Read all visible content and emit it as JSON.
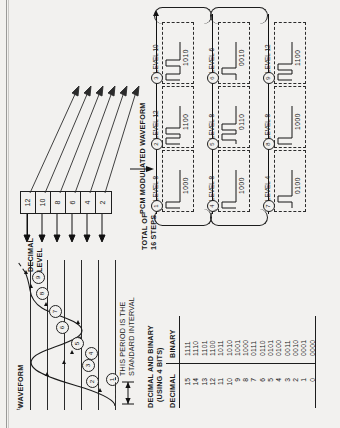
{
  "figure": {
    "waveform_panel": {
      "title": "WAVEFORM",
      "interval_note_line1": "THIS PERIOD IS THE",
      "interval_note_line2": "STANDARD INTERVAL",
      "interval_symbol": "t",
      "interval_symbol_sub": "s",
      "sample_points": [
        "1",
        "2",
        "3",
        "4",
        "5",
        "6",
        "7",
        "8",
        "9"
      ]
    },
    "decimal_level_scale": {
      "label_line1": "DECIMAL",
      "label_line2": "LEVEL",
      "values": [
        "12",
        "10",
        "8",
        "6",
        "4",
        "2"
      ]
    },
    "steps_note": {
      "line1": "TOTAL OF",
      "line2": "16 STEPS"
    },
    "table": {
      "title_line1": "DECIMAL AND BINARY",
      "title_line2": "(USING 4 BITS)",
      "columns": [
        "DECIMAL",
        "BINARY"
      ],
      "rows": [
        {
          "decimal": "15",
          "binary": "1111"
        },
        {
          "decimal": "14",
          "binary": "1110"
        },
        {
          "decimal": "13",
          "binary": "1101"
        },
        {
          "decimal": "12",
          "binary": "1100"
        },
        {
          "decimal": "11",
          "binary": "1011"
        },
        {
          "decimal": "10",
          "binary": "1010"
        },
        {
          "decimal": "9",
          "binary": "1001"
        },
        {
          "decimal": "8",
          "binary": "1000"
        },
        {
          "decimal": "7",
          "binary": "0111"
        },
        {
          "decimal": "6",
          "binary": "0110"
        },
        {
          "decimal": "5",
          "binary": "0101"
        },
        {
          "decimal": "4",
          "binary": "0100"
        },
        {
          "decimal": "3",
          "binary": "0011"
        },
        {
          "decimal": "2",
          "binary": "0010"
        },
        {
          "decimal": "1",
          "binary": "0001"
        },
        {
          "decimal": "0",
          "binary": "0000"
        }
      ]
    },
    "pcm_panel": {
      "title": "PCM MODULATED WAVEFORM",
      "samples": [
        {
          "index": "1",
          "level_label": "LEVEL 8",
          "code": "1000"
        },
        {
          "index": "2",
          "level_label": "LEVEL 12",
          "code": "1100"
        },
        {
          "index": "3",
          "level_label": "LEVEL 10",
          "code": "1010"
        },
        {
          "index": "4",
          "level_label": "LEVEL 8",
          "code": "1000"
        },
        {
          "index": "5",
          "level_label": "LEVEL 8",
          "code": "0110"
        },
        {
          "index": "6",
          "level_label": "LEVEL 6",
          "code": "0010"
        },
        {
          "index": "7",
          "level_label": "LEVEL 4",
          "code": "0100"
        },
        {
          "index": "8",
          "level_label": "LEVEL 8",
          "code": "1000"
        },
        {
          "index": "9",
          "level_label": "LEVEL 12",
          "code": "1100"
        }
      ],
      "row_level_labels": [
        "LEVEL 2"
      ]
    }
  },
  "chart_data": {
    "type": "line",
    "title": "WAVEFORM",
    "xlabel": "",
    "ylabel": "DECIMAL LEVEL",
    "ylim": [
      0,
      14
    ],
    "grid": true,
    "legend": "none",
    "x": [
      1,
      2,
      3,
      4,
      5,
      6,
      7,
      8,
      9
    ],
    "categories": [
      "1",
      "2",
      "3",
      "4",
      "5",
      "6",
      "7",
      "8",
      "9"
    ],
    "series": [
      {
        "name": "Sampled decimal level",
        "values": [
          8,
          12,
          10,
          8,
          8,
          6,
          4,
          8,
          12
        ]
      }
    ],
    "annotations": [
      "THIS PERIOD IS THE STANDARD INTERVAL",
      "TOTAL OF 16 STEPS"
    ],
    "ytick_labels": [
      "2",
      "4",
      "6",
      "8",
      "10",
      "12"
    ],
    "ytick_values": [
      2,
      4,
      6,
      8,
      10,
      12
    ]
  }
}
